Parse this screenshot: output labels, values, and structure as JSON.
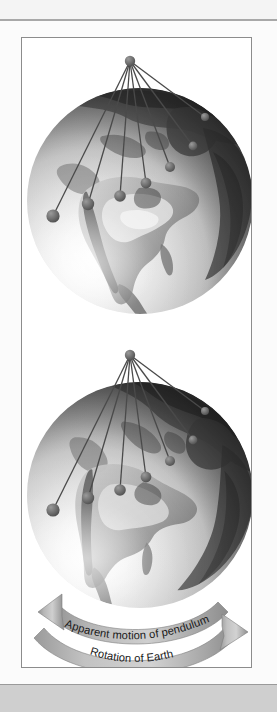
{
  "figure": {
    "frame_border_color": "#8c8c8c",
    "panel_background": "#ffffff",
    "page_background": "#f4f4f4"
  },
  "globes": [
    {
      "id": "globe-top",
      "caption": "Earth at initial time with pendulum swing plane",
      "region_shown": "North America",
      "rotation_deg": 0,
      "bob_count": 7,
      "pivot_label": "pendulum pivot"
    },
    {
      "id": "globe-bottom",
      "caption": "Earth rotated beneath the pendulum",
      "region_shown": "North America",
      "rotation_deg": 18,
      "bob_count": 7,
      "pivot_label": "pendulum pivot"
    }
  ],
  "pendulum": {
    "string_color": "#4a4a4a",
    "bob_color": "#6d6d6d",
    "pivot_color": "#6d6d6d",
    "bob_count": 7
  },
  "arrows": [
    {
      "id": "apparent-motion-arrow",
      "label": "Apparent motion of pendulum",
      "direction": "left",
      "color": "#9d9d9d"
    },
    {
      "id": "rotation-of-earth-arrow",
      "label": "Rotation of Earth",
      "direction": "right",
      "color": "#9d9d9d"
    }
  ],
  "colors": {
    "arrow_light": "#c9c9c9",
    "arrow_mid": "#a5a5a5",
    "arrow_dark": "#8a8a8a",
    "label_text": "#1a1a1a",
    "land_dark": "#4f4f4f",
    "land_mid": "#8e8e8e",
    "land_light": "#cfcfcf"
  }
}
